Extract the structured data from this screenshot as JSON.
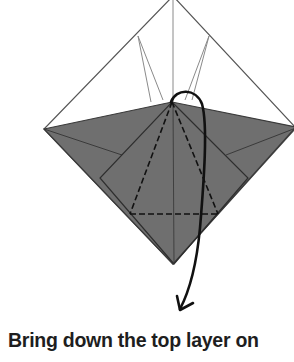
{
  "caption": "Bring down the top layer on",
  "colors": {
    "paper_gray": "#6f6f6f",
    "outline": "#3a3a3a",
    "thin_line": "#8a8a8a",
    "arrow": "#111111",
    "text": "#1e1e1e"
  },
  "diagram": {
    "fold_lines": [
      "valley-fold-dashed-left",
      "valley-fold-dashed-right",
      "valley-fold-dashed-horizontal"
    ]
  }
}
